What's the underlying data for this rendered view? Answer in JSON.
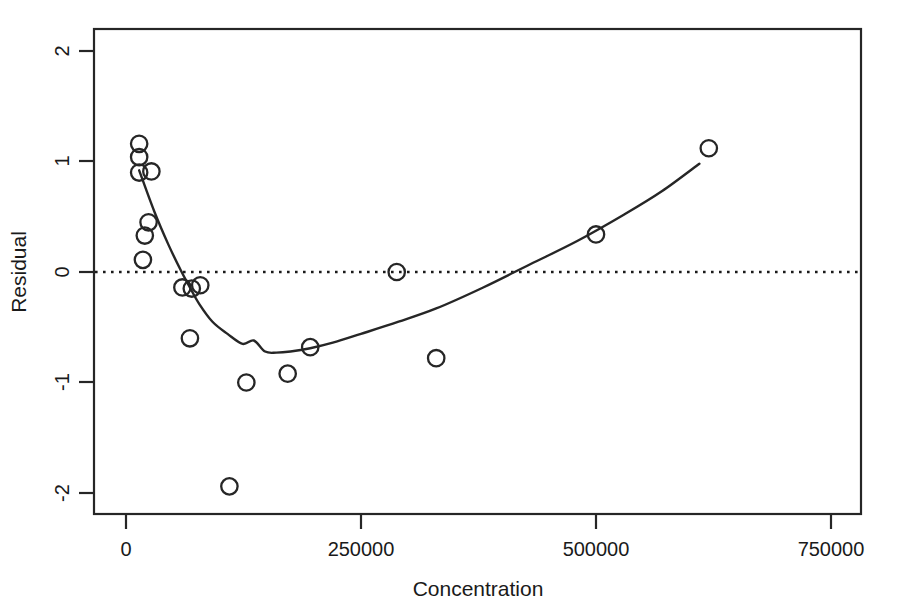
{
  "chart_data": {
    "type": "scatter",
    "title": "",
    "xlabel": "Concentration",
    "ylabel": "Residual",
    "xlim": [
      -33900,
      814000
    ],
    "ylim": [
      -2.2,
      2.2
    ],
    "xticks": [
      0,
      250000,
      500000,
      750000
    ],
    "xticklabels": [
      "0",
      "250000",
      "500000",
      "750000"
    ],
    "yticks": [
      2,
      1,
      0,
      -1,
      -2
    ],
    "yticklabels": [
      "2",
      "1",
      "0",
      "-1",
      "-2"
    ],
    "grid": false,
    "legend": false,
    "marker": "open-circle",
    "reference_line": {
      "y": 0,
      "style": "dotted"
    },
    "points": [
      {
        "x": 14000,
        "y": 1.16
      },
      {
        "x": 14000,
        "y": 1.04
      },
      {
        "x": 14000,
        "y": 0.9
      },
      {
        "x": 27000,
        "y": 0.91
      },
      {
        "x": 24000,
        "y": 0.45
      },
      {
        "x": 20000,
        "y": 0.33
      },
      {
        "x": 18000,
        "y": 0.11
      },
      {
        "x": 60000,
        "y": -0.14
      },
      {
        "x": 70000,
        "y": -0.15
      },
      {
        "x": 79000,
        "y": -0.12
      },
      {
        "x": 68000,
        "y": -0.6
      },
      {
        "x": 128000,
        "y": -1.0
      },
      {
        "x": 172000,
        "y": -0.92
      },
      {
        "x": 196000,
        "y": -0.68
      },
      {
        "x": 288000,
        "y": 0.0
      },
      {
        "x": 330000,
        "y": -0.78
      },
      {
        "x": 500000,
        "y": 0.34
      },
      {
        "x": 620000,
        "y": 1.12
      },
      {
        "x": 110000,
        "y": -1.94
      }
    ],
    "fit_curve": {
      "name": "lowess-smooth",
      "x": [
        14000,
        30000,
        45000,
        58000,
        68000,
        78000,
        92000,
        108000,
        124000,
        136000,
        148000,
        160000,
        175000,
        196000,
        220000,
        250000,
        290000,
        330000,
        380000,
        430000,
        480000,
        530000,
        570000,
        610000
      ],
      "y": [
        0.92,
        0.55,
        0.25,
        0.02,
        -0.14,
        -0.29,
        -0.45,
        -0.56,
        -0.65,
        -0.62,
        -0.72,
        -0.73,
        -0.72,
        -0.69,
        -0.64,
        -0.56,
        -0.45,
        -0.33,
        -0.14,
        0.07,
        0.28,
        0.52,
        0.73,
        0.98
      ]
    }
  }
}
